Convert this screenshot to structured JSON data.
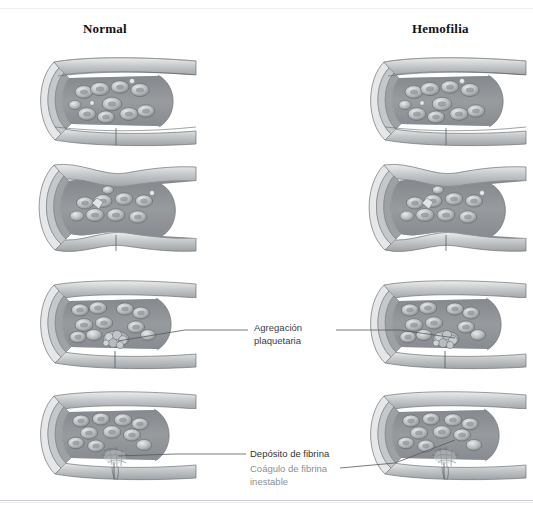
{
  "figure": {
    "background_color": "#ffffff",
    "line_color": "#4a4f54",
    "columns": [
      {
        "id": "normal",
        "label": "Normal"
      },
      {
        "id": "hemofilia",
        "label": "Hemofilia"
      }
    ],
    "stages": [
      {
        "index": 1,
        "state": "vaso-intacto"
      },
      {
        "index": 2,
        "state": "vasoconstriccion"
      },
      {
        "index": 3,
        "state": "agregacion-plaquetaria"
      },
      {
        "index": 4,
        "state": "deposito-de-fibrina"
      }
    ],
    "annotations": [
      {
        "id": "agregacion-plaquetaria",
        "text": "Agregación\nplaquetaria",
        "color": "#3c4043"
      },
      {
        "id": "deposito-de-fibrina",
        "text": "Depósito de fibrina",
        "color": "#2f3336"
      },
      {
        "id": "coagulo-de-fibrina-inestable",
        "text": "Coágulo de fibrina\ninestable",
        "color": "#8a8f94"
      }
    ]
  }
}
